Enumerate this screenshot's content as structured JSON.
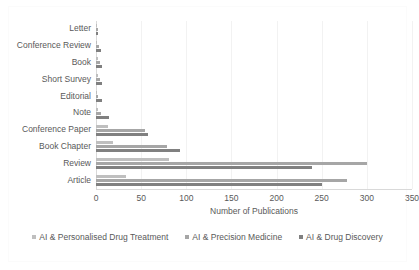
{
  "chart_data": {
    "type": "bar",
    "orientation": "horizontal",
    "title": "",
    "xlabel": "Number of Publications",
    "ylabel": "",
    "xlim": [
      0,
      350
    ],
    "xticks": [
      0,
      50,
      100,
      150,
      200,
      250,
      300,
      350
    ],
    "grid": true,
    "legend_position": "bottom",
    "categories": [
      "Letter",
      "Conference Review",
      "Book",
      "Short Survey",
      "Editorial",
      "Note",
      "Conference Paper",
      "Book Chapter",
      "Review",
      "Article"
    ],
    "series": [
      {
        "name": "AI & Personalised Drug Treatment",
        "color": "#bfbfbf",
        "values": [
          1,
          1,
          2,
          2,
          1,
          2,
          13,
          19,
          81,
          33
        ]
      },
      {
        "name": "AI & Precision Medicine",
        "color": "#a6a6a6",
        "values": [
          2,
          3,
          4,
          4,
          2,
          5,
          54,
          79,
          300,
          278
        ]
      },
      {
        "name": "AI & Drug Discovery",
        "color": "#808080",
        "values": [
          2,
          5,
          7,
          7,
          7,
          14,
          58,
          93,
          239,
          250
        ]
      }
    ]
  }
}
